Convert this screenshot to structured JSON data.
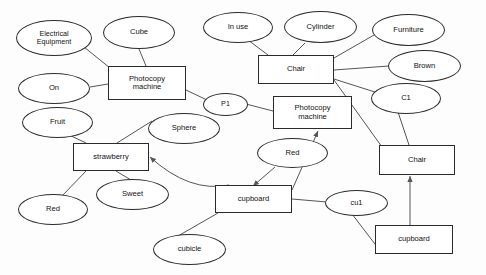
{
  "diagram": {
    "type": "node-link-diagram",
    "canvas": {
      "width": 486,
      "height": 275
    },
    "style": {
      "stroke": "#2b2b2b",
      "edge_stroke": "#555555",
      "background": "#fdfdfd",
      "text_color": "#111111"
    },
    "nodes": [
      {
        "id": "electrical_equipment",
        "label": "Electrical\nEquipment",
        "shape": "ellipse",
        "x": 16,
        "y": 20,
        "w": 76,
        "h": 36,
        "font": 7.2
      },
      {
        "id": "cube",
        "label": "Cube",
        "shape": "ellipse",
        "x": 103,
        "y": 16,
        "w": 72,
        "h": 33,
        "font": 7.6
      },
      {
        "id": "in_use",
        "label": "In use",
        "shape": "ellipse",
        "x": 203,
        "y": 12,
        "w": 70,
        "h": 31,
        "font": 7.6
      },
      {
        "id": "cylinder",
        "label": "Cylinder",
        "shape": "ellipse",
        "x": 284,
        "y": 11,
        "w": 73,
        "h": 32,
        "font": 7.6
      },
      {
        "id": "furniture",
        "label": "Furniture",
        "shape": "ellipse",
        "x": 372,
        "y": 14,
        "w": 73,
        "h": 32,
        "font": 7.6
      },
      {
        "id": "brown",
        "label": "Brown",
        "shape": "ellipse",
        "x": 388,
        "y": 50,
        "w": 73,
        "h": 32,
        "font": 7.6
      },
      {
        "id": "c1",
        "label": "C1",
        "shape": "ellipse",
        "x": 371,
        "y": 83,
        "w": 70,
        "h": 31,
        "font": 7.6
      },
      {
        "id": "on",
        "label": "On",
        "shape": "ellipse",
        "x": 18,
        "y": 73,
        "w": 72,
        "h": 31,
        "font": 7.6
      },
      {
        "id": "fruit",
        "label": "Fruit",
        "shape": "ellipse",
        "x": 22,
        "y": 107,
        "w": 71,
        "h": 31,
        "font": 7.6
      },
      {
        "id": "sphere",
        "label": "Sphere",
        "shape": "ellipse",
        "x": 148,
        "y": 113,
        "w": 72,
        "h": 31,
        "font": 7.6
      },
      {
        "id": "p1",
        "label": "P1",
        "shape": "ellipse",
        "x": 203,
        "y": 93,
        "w": 45,
        "h": 23,
        "font": 7.2
      },
      {
        "id": "red_fruit",
        "label": "Red",
        "shape": "ellipse",
        "x": 18,
        "y": 194,
        "w": 70,
        "h": 31,
        "font": 7.6
      },
      {
        "id": "sweet",
        "label": "Sweet",
        "shape": "ellipse",
        "x": 96,
        "y": 179,
        "w": 73,
        "h": 31,
        "font": 7.6
      },
      {
        "id": "red_cupboard",
        "label": "Red",
        "shape": "ellipse",
        "x": 257,
        "y": 138,
        "w": 71,
        "h": 30,
        "font": 7.6
      },
      {
        "id": "cubicle",
        "label": "cubicle",
        "shape": "ellipse",
        "x": 153,
        "y": 234,
        "w": 73,
        "h": 31,
        "font": 7.6
      },
      {
        "id": "cu1",
        "label": "cu1",
        "shape": "ellipse",
        "x": 325,
        "y": 190,
        "w": 63,
        "h": 26,
        "font": 7.4
      },
      {
        "id": "photocopy_machine_1",
        "label": "Photocopy\nmachine",
        "shape": "rect",
        "x": 108,
        "y": 66,
        "w": 78,
        "h": 34,
        "font": 7.6
      },
      {
        "id": "chair_top",
        "label": "Chair",
        "shape": "rect",
        "x": 258,
        "y": 55,
        "w": 76,
        "h": 29,
        "font": 7.6
      },
      {
        "id": "photocopy_machine_2",
        "label": "Photocopy\nmachine",
        "shape": "rect",
        "x": 273,
        "y": 96,
        "w": 79,
        "h": 33,
        "font": 7.6
      },
      {
        "id": "strawberry",
        "label": "strawberry",
        "shape": "rect",
        "x": 73,
        "y": 143,
        "w": 76,
        "h": 28,
        "font": 7.6
      },
      {
        "id": "chair_right",
        "label": "Chair",
        "shape": "rect",
        "x": 379,
        "y": 145,
        "w": 76,
        "h": 30,
        "font": 7.6
      },
      {
        "id": "cupboard_mid",
        "label": "cupboard",
        "shape": "rect",
        "x": 215,
        "y": 185,
        "w": 77,
        "h": 28,
        "font": 7.6
      },
      {
        "id": "cupboard_bottom",
        "label": "cupboard",
        "shape": "rect",
        "x": 375,
        "y": 225,
        "w": 78,
        "h": 29,
        "font": 7.6
      }
    ],
    "edges": [
      {
        "id": "e1",
        "from": "electrical_equipment",
        "to": "photocopy_machine_1",
        "x1": 84,
        "y1": 47,
        "x2": 110,
        "y2": 68,
        "arrow": false
      },
      {
        "id": "e2",
        "from": "cube",
        "to": "photocopy_machine_1",
        "x1": 139,
        "y1": 49,
        "x2": 146,
        "y2": 66,
        "arrow": false
      },
      {
        "id": "e3",
        "from": "on",
        "to": "photocopy_machine_1",
        "x1": 90,
        "y1": 87,
        "x2": 108,
        "y2": 84,
        "arrow": false
      },
      {
        "id": "e4",
        "from": "photocopy_machine_1",
        "to": "p1",
        "x1": 186,
        "y1": 90,
        "x2": 207,
        "y2": 100,
        "arrow": false
      },
      {
        "id": "e5",
        "from": "in_use",
        "to": "chair_top",
        "x1": 248,
        "y1": 40,
        "x2": 268,
        "y2": 55,
        "arrow": false
      },
      {
        "id": "e6",
        "from": "cylinder",
        "to": "chair_top",
        "x1": 305,
        "y1": 43,
        "x2": 293,
        "y2": 55,
        "arrow": false
      },
      {
        "id": "e7",
        "from": "furniture",
        "to": "chair_top",
        "x1": 374,
        "y1": 35,
        "x2": 334,
        "y2": 58,
        "arrow": false
      },
      {
        "id": "e8",
        "from": "brown",
        "to": "chair_top",
        "x1": 389,
        "y1": 66,
        "x2": 334,
        "y2": 70,
        "arrow": false
      },
      {
        "id": "e9",
        "from": "c1",
        "to": "chair_top",
        "x1": 378,
        "y1": 93,
        "x2": 334,
        "y2": 79,
        "arrow": false
      },
      {
        "id": "e10",
        "from": "p1",
        "to": "photocopy_machine_2",
        "x1": 246,
        "y1": 104,
        "x2": 273,
        "y2": 111,
        "arrow": false
      },
      {
        "id": "e11",
        "from": "fruit",
        "to": "strawberry",
        "x1": 65,
        "y1": 133,
        "x2": 86,
        "y2": 143,
        "arrow": false
      },
      {
        "id": "e12",
        "from": "sphere",
        "to": "strawberry",
        "x1": 152,
        "y1": 121,
        "x2": 117,
        "y2": 143,
        "arrow": false
      },
      {
        "id": "e13",
        "from": "strawberry",
        "to": "red_fruit",
        "x1": 86,
        "y1": 171,
        "x2": 62,
        "y2": 196,
        "arrow": false
      },
      {
        "id": "e14",
        "from": "strawberry",
        "to": "sweet",
        "x1": 116,
        "y1": 171,
        "x2": 131,
        "y2": 180,
        "arrow": false
      },
      {
        "id": "e15",
        "from": "cupboard_mid",
        "to": "strawberry",
        "x1": 229,
        "y1": 185,
        "x2": 150,
        "y2": 157,
        "arrow": true,
        "curve": 22
      },
      {
        "id": "e16",
        "from": "red_cupboard",
        "to": "cupboard_mid",
        "x1": 275,
        "y1": 167,
        "x2": 253,
        "y2": 186,
        "arrow": true
      },
      {
        "id": "e17",
        "from": "cupboard_mid",
        "to": "cubicle",
        "x1": 218,
        "y1": 213,
        "x2": 178,
        "y2": 236,
        "arrow": false
      },
      {
        "id": "e18",
        "from": "cupboard_mid",
        "to": "cu1",
        "x1": 292,
        "y1": 199,
        "x2": 327,
        "y2": 202,
        "arrow": false
      },
      {
        "id": "e19",
        "from": "cu1",
        "to": "cupboard_bottom",
        "x1": 352,
        "y1": 214,
        "x2": 378,
        "y2": 248,
        "arrow": false
      },
      {
        "id": "e20",
        "from": "cupboard_bottom",
        "to": "chair_right",
        "x1": 410,
        "y1": 225,
        "x2": 410,
        "y2": 176,
        "arrow": true
      },
      {
        "id": "e21",
        "from": "c1",
        "to": "chair_right",
        "x1": 398,
        "y1": 112,
        "x2": 409,
        "y2": 145,
        "arrow": false
      },
      {
        "id": "e22",
        "from": "chair_top",
        "to": "chair_right",
        "x1": 334,
        "y1": 80,
        "x2": 382,
        "y2": 147,
        "arrow": false
      },
      {
        "id": "e23",
        "from": "cupboard_mid",
        "to": "photocopy_machine_2",
        "x1": 292,
        "y1": 190,
        "x2": 318,
        "y2": 131,
        "arrow": true
      }
    ]
  }
}
